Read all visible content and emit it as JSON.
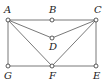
{
  "diagram": {
    "points": [
      {
        "id": "A",
        "label": "A",
        "x": 8,
        "y": 20,
        "lx": 4,
        "ly": 13
      },
      {
        "id": "B",
        "label": "B",
        "x": 52,
        "y": 20,
        "lx": 49,
        "ly": 13
      },
      {
        "id": "C",
        "label": "C",
        "x": 96,
        "y": 20,
        "lx": 94,
        "ly": 13
      },
      {
        "id": "D",
        "label": "D",
        "x": 52,
        "y": 38,
        "lx": 49,
        "ly": 50
      },
      {
        "id": "G",
        "label": "G",
        "x": 8,
        "y": 66,
        "lx": 4,
        "ly": 79
      },
      {
        "id": "F",
        "label": "F",
        "x": 52,
        "y": 66,
        "lx": 49,
        "ly": 79
      },
      {
        "id": "E",
        "label": "E",
        "x": 96,
        "y": 66,
        "lx": 93,
        "ly": 79
      }
    ],
    "edges": [
      [
        "A",
        "C"
      ],
      [
        "A",
        "G"
      ],
      [
        "C",
        "E"
      ],
      [
        "G",
        "E"
      ],
      [
        "A",
        "D"
      ],
      [
        "D",
        "C"
      ],
      [
        "A",
        "F"
      ],
      [
        "F",
        "C"
      ]
    ]
  }
}
